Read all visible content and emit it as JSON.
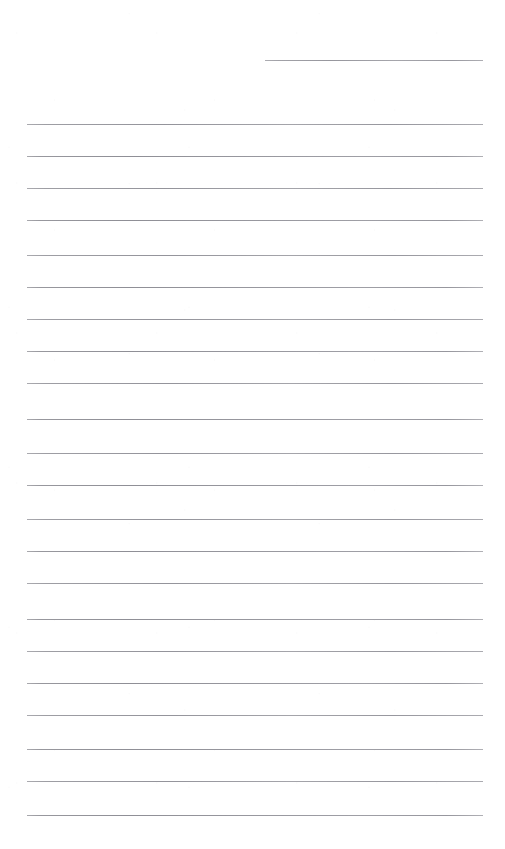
{
  "document": {
    "kind": "ruled-paper-scan",
    "title": "",
    "body_text": "",
    "page_width": 505,
    "page_height": 849,
    "background_color": "#ffffff",
    "rule_color": "#a9a9ae",
    "rule_thickness_px": 1,
    "rule_spacing_px": 32,
    "rule_count": 23,
    "left_margin_px": 27,
    "right_margin_px": 22,
    "content_right_edge_px": 483,
    "top_margin_px": 60,
    "bottom_margin_px": 34,
    "has_text": false,
    "has_margin_rule": false,
    "has_holes": false
  },
  "rules": [
    {
      "id": "rule-1",
      "y": 60,
      "x": 265,
      "width": 218,
      "partial": true
    },
    {
      "id": "rule-2",
      "y": 124,
      "x": 27,
      "width": 456,
      "partial": false
    },
    {
      "id": "rule-3",
      "y": 156,
      "x": 27,
      "width": 456,
      "partial": false
    },
    {
      "id": "rule-4",
      "y": 188,
      "x": 27,
      "width": 456,
      "partial": false
    },
    {
      "id": "rule-5",
      "y": 220,
      "x": 27,
      "width": 456,
      "partial": false
    },
    {
      "id": "rule-6",
      "y": 255,
      "x": 27,
      "width": 456,
      "partial": false
    },
    {
      "id": "rule-7",
      "y": 287,
      "x": 27,
      "width": 456,
      "partial": false
    },
    {
      "id": "rule-8",
      "y": 319,
      "x": 27,
      "width": 456,
      "partial": false
    },
    {
      "id": "rule-9",
      "y": 351,
      "x": 27,
      "width": 456,
      "partial": false
    },
    {
      "id": "rule-10",
      "y": 383,
      "x": 27,
      "width": 456,
      "partial": false
    },
    {
      "id": "rule-11",
      "y": 419,
      "x": 27,
      "width": 456,
      "partial": false
    },
    {
      "id": "rule-12",
      "y": 453,
      "x": 27,
      "width": 456,
      "partial": false
    },
    {
      "id": "rule-13",
      "y": 485,
      "x": 27,
      "width": 456,
      "partial": false
    },
    {
      "id": "rule-14",
      "y": 519,
      "x": 27,
      "width": 456,
      "partial": false
    },
    {
      "id": "rule-15",
      "y": 551,
      "x": 27,
      "width": 456,
      "partial": false
    },
    {
      "id": "rule-16",
      "y": 583,
      "x": 27,
      "width": 456,
      "partial": false
    },
    {
      "id": "rule-17",
      "y": 619,
      "x": 27,
      "width": 456,
      "partial": false
    },
    {
      "id": "rule-18",
      "y": 651,
      "x": 27,
      "width": 456,
      "partial": false
    },
    {
      "id": "rule-19",
      "y": 683,
      "x": 27,
      "width": 456,
      "partial": false
    },
    {
      "id": "rule-20",
      "y": 715,
      "x": 27,
      "width": 456,
      "partial": false
    },
    {
      "id": "rule-21",
      "y": 749,
      "x": 27,
      "width": 456,
      "partial": false
    },
    {
      "id": "rule-22",
      "y": 781,
      "x": 27,
      "width": 456,
      "partial": false
    },
    {
      "id": "rule-23",
      "y": 815,
      "x": 27,
      "width": 456,
      "partial": false
    }
  ]
}
